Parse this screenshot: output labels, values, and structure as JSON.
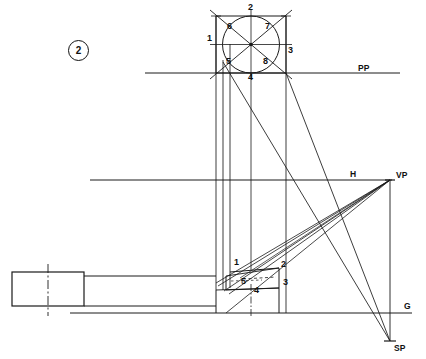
{
  "figure": {
    "number": "2",
    "title_labels": {
      "picture_plane": "PP",
      "horizon": "H",
      "vanishing_point": "VP",
      "ground_line": "G",
      "station_point": "SP"
    }
  },
  "colors": {
    "line": "#1a1a1a",
    "background": "#ffffff",
    "thin": "#333333"
  },
  "plan_view": {
    "description": "circle inscribed in square with diagonals",
    "square": {
      "x": 216,
      "y": 16,
      "width": 70,
      "height": 57
    },
    "circle": {
      "cx": 251,
      "cy": 44.5,
      "r": 28.5
    },
    "point_labels": [
      {
        "id": "1",
        "x": 207,
        "y": 39
      },
      {
        "id": "2",
        "x": 248,
        "y": 6
      },
      {
        "id": "3",
        "x": 288,
        "y": 50
      },
      {
        "id": "4",
        "x": 248,
        "y": 76
      },
      {
        "id": "5",
        "x": 228,
        "y": 62
      },
      {
        "id": "6",
        "x": 229,
        "y": 26
      },
      {
        "id": "7",
        "x": 267,
        "y": 26
      },
      {
        "id": "8",
        "x": 265,
        "y": 62
      }
    ]
  },
  "perspective_view": {
    "description": "box in two point perspective below ground",
    "point_labels": [
      {
        "id": "1",
        "x": 236,
        "y": 261
      },
      {
        "id": "2",
        "x": 283,
        "y": 263
      },
      {
        "id": "3",
        "x": 285,
        "y": 282
      },
      {
        "id": "4",
        "x": 256,
        "y": 289
      },
      {
        "id": "5",
        "x": 243,
        "y": 281
      }
    ]
  },
  "reference_lines": {
    "pp": {
      "y": 73,
      "x1": 145,
      "x2": 400,
      "label_x": 358,
      "label_y": 64
    },
    "horizon": {
      "y": 180,
      "x1": 90,
      "x2": 392,
      "label_x": 350,
      "label_y": 171
    },
    "ground": {
      "y": 313,
      "x1": 70,
      "x2": 412,
      "label_x": 404,
      "label_y": 303
    },
    "vp": {
      "x": 390,
      "y": 180,
      "label_x": 396,
      "label_y": 172
    },
    "sp": {
      "x": 390,
      "y": 341,
      "label_x": 394,
      "label_y": 344
    }
  },
  "plan_object": {
    "rectangle": {
      "x": 12,
      "y": 272,
      "width": 72,
      "height": 34
    }
  }
}
